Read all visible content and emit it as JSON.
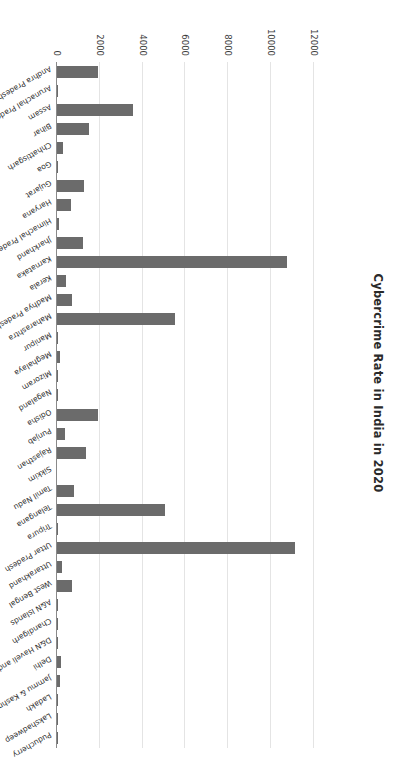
{
  "chart": {
    "title": "Cybercrime Rate in India in 2020",
    "xlabel": "",
    "ylabel": ""
  },
  "chart_data": {
    "type": "bar",
    "title": "Cybercrime Rate in India in 2020",
    "xlabel": "",
    "ylabel": "",
    "ylim": [
      0,
      12000
    ],
    "grid": true,
    "legend": false,
    "orientation": "vertical",
    "tick_labels": [
      "0",
      "2000",
      "4000",
      "6000",
      "8000",
      "10000",
      "12000"
    ],
    "ticks": [
      0,
      2000,
      4000,
      6000,
      8000,
      10000,
      12000
    ],
    "bar_color": "#6b6b6b",
    "categories": [
      "Andhra Pradesh",
      "Arunachal Pradesh",
      "Assam",
      "Bihar",
      "Chhattisgarh",
      "Goa",
      "Gujarat",
      "Haryana",
      "Himachal Pradesh",
      "Jharkhand",
      "Karnataka",
      "Kerala",
      "Madhya Pradesh",
      "Maharashtra",
      "Manipur",
      "Meghalaya",
      "Mizoram",
      "Nagaland",
      "Odisha",
      "Punjab",
      "Rajasthan",
      "Sikkim",
      "Tamil Nadu",
      "Telangana",
      "Tripura",
      "Uttar Pradesh",
      "Uttarakhand",
      "West Bengal",
      "A&N Islands",
      "Chandigarh",
      "D&N Haveli and Daman & Diu",
      "Delhi",
      "Jammu & Kashmir",
      "Ladakh",
      "Lakshadweep",
      "Puducherry"
    ],
    "values": [
      1899,
      30,
      3530,
      1512,
      297,
      40,
      1283,
      656,
      98,
      1204,
      10741,
      426,
      699,
      5496,
      12,
      142,
      13,
      8,
      1931,
      378,
      1354,
      0,
      782,
      5024,
      34,
      11097,
      243,
      712,
      50,
      17,
      3,
      168,
      120,
      1,
      1,
      5
    ]
  }
}
